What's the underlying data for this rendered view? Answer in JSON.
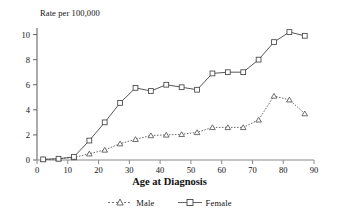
{
  "chart_data": {
    "type": "line",
    "title": "",
    "xlabel": "Age at Diagnosis",
    "ylabel": "Rate per 100,000",
    "xlim": [
      0,
      90
    ],
    "ylim": [
      0,
      11
    ],
    "xticks": [
      0,
      10,
      20,
      30,
      40,
      50,
      60,
      70,
      80,
      90
    ],
    "yticks": [
      0,
      2,
      4,
      6,
      8,
      10
    ],
    "xtick_labels": [
      "0",
      "10",
      "20",
      "30",
      "40",
      "50",
      "60",
      "70",
      "80",
      "90"
    ],
    "ytick_labels": [
      "0",
      "2",
      "4",
      "6",
      "8",
      "10"
    ],
    "grid": false,
    "legend_position": "bottom",
    "x": [
      2,
      7,
      12,
      17,
      22,
      27,
      32,
      37,
      42,
      47,
      52,
      57,
      62,
      67,
      72,
      77,
      82,
      87
    ],
    "series": [
      {
        "name": "Male",
        "marker": "triangle",
        "line_style": "dotted",
        "color": "#555555",
        "values": [
          0.05,
          0.1,
          0.2,
          0.5,
          0.8,
          1.3,
          1.65,
          1.95,
          2.0,
          2.05,
          2.2,
          2.6,
          2.6,
          2.6,
          3.2,
          5.1,
          4.8,
          3.7
        ]
      },
      {
        "name": "Female",
        "marker": "square",
        "line_style": "solid",
        "color": "#444444",
        "values": [
          0.05,
          0.1,
          0.25,
          1.55,
          3.0,
          4.55,
          5.75,
          5.5,
          6.0,
          5.8,
          5.6,
          6.9,
          7.0,
          7.0,
          8.0,
          9.4,
          10.2,
          9.9
        ]
      }
    ]
  },
  "legend": {
    "items": [
      {
        "label": "Male"
      },
      {
        "label": "Female"
      }
    ]
  },
  "axes": {
    "y_axis_title": "Rate per 100,000",
    "x_axis_title": "Age at Diagnosis"
  }
}
